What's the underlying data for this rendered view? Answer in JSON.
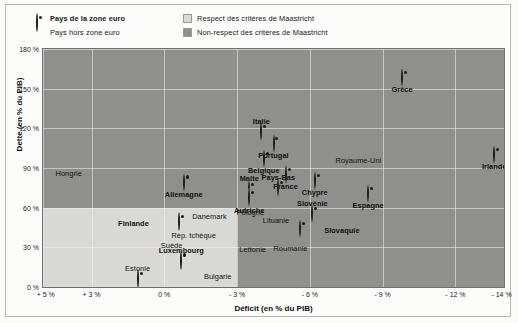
{
  "legend": {
    "items": [
      {
        "marker": "euro-circle-marker",
        "label": "Pays de la zone euro",
        "bold": true
      },
      {
        "marker": "dot-marker",
        "label": "Pays hors zone euro",
        "bold": false
      },
      {
        "marker": "light-swatch",
        "label": "Respect des critères de Maastricht",
        "bold": false
      },
      {
        "marker": "dark-swatch",
        "label": "Non-respect des critères de Maastricht",
        "bold": false
      }
    ]
  },
  "colors": {
    "respect_zone": "#d8d8d4",
    "non_respect_zone": "#8f8f8c",
    "marker": "#1d1d1d",
    "grid": "#f3f3f0"
  },
  "chart_data": {
    "type": "scatter",
    "title": "",
    "xlabel": "Déficit (en % du PIB)",
    "ylabel": "Dette (en % du PIB)",
    "xlim": [
      5,
      -14
    ],
    "ylim": [
      0,
      180
    ],
    "xticks": [
      "+ 5 %",
      "+ 3 %",
      "0 %",
      "- 3 %",
      "- 6 %",
      "- 9 %",
      "- 12 %",
      "- 14 %"
    ],
    "xtick_values": [
      5,
      3,
      0,
      -3,
      -6,
      -9,
      -12,
      -14
    ],
    "yticks": [
      "0 %",
      "30 %",
      "60 %",
      "90 %",
      "120 %",
      "150 %",
      "180 %"
    ],
    "ytick_values": [
      0,
      30,
      60,
      90,
      120,
      150,
      180
    ],
    "grid": true,
    "legend_position": "top",
    "maastricht_zone": {
      "x_from": 5,
      "x_to": -3,
      "y_from": 0,
      "y_to": 60
    },
    "points": [
      {
        "name": "Hongrie",
        "x": 3.9,
        "y": 78,
        "euro": false,
        "lx": -1,
        "ly": -11,
        "bold": false
      },
      {
        "name": "Allemagne",
        "x": -0.8,
        "y": 79,
        "euro": true,
        "lx": 0,
        "ly": 11,
        "bold": true
      },
      {
        "name": "Danemark",
        "x": -1.9,
        "y": 46,
        "euro": false,
        "lx": -1,
        "ly": -10,
        "bold": false
      },
      {
        "name": "Finlande",
        "x": -0.6,
        "y": 49,
        "euro": true,
        "lx": -30,
        "ly": 1,
        "bold": true
      },
      {
        "name": "Suède",
        "x": -0.3,
        "y": 39,
        "euro": false,
        "lx": 0,
        "ly": 10,
        "bold": false
      },
      {
        "name": "Rép. tchèque",
        "x": -3.2,
        "y": 41,
        "euro": false,
        "lx": -26,
        "ly": 2,
        "bold": false
      },
      {
        "name": "Lettonie",
        "x": -3.6,
        "y": 37,
        "euro": false,
        "lx": 1,
        "ly": 11,
        "bold": false
      },
      {
        "name": "Luxembourg",
        "x": -0.7,
        "y": 20,
        "euro": true,
        "lx": 0,
        "ly": -11,
        "bold": true
      },
      {
        "name": "Estonie",
        "x": 1.1,
        "y": 6,
        "euro": true,
        "lx": 0,
        "ly": -11,
        "bold": false
      },
      {
        "name": "Bulgarie",
        "x": -2.2,
        "y": 17,
        "euro": false,
        "lx": 0,
        "ly": 11,
        "bold": false
      },
      {
        "name": "Malte",
        "x": -3.5,
        "y": 73,
        "euro": true,
        "lx": 0,
        "ly": -12,
        "bold": true
      },
      {
        "name": "Autriche",
        "x": -3.5,
        "y": 67,
        "euro": true,
        "lx": 0,
        "ly": 12,
        "bold": true
      },
      {
        "name": "Belgique",
        "x": -4.1,
        "y": 97,
        "euro": true,
        "lx": 0,
        "ly": 11,
        "bold": true
      },
      {
        "name": "Portugal",
        "x": -4.5,
        "y": 108,
        "euro": true,
        "lx": 0,
        "ly": 11,
        "bold": true
      },
      {
        "name": "Italie",
        "x": -4.0,
        "y": 117,
        "euro": true,
        "lx": 0,
        "ly": -11,
        "bold": true
      },
      {
        "name": "France",
        "x": -5.0,
        "y": 85,
        "euro": true,
        "lx": 0,
        "ly": 11,
        "bold": true
      },
      {
        "name": "Pays-Bas",
        "x": -4.7,
        "y": 75,
        "euro": true,
        "lx": 0,
        "ly": -11,
        "bold": true
      },
      {
        "name": "Pologne",
        "x": -5.1,
        "y": 56,
        "euro": false,
        "lx": -24,
        "ly": -1,
        "bold": false
      },
      {
        "name": "Lituanie",
        "x": -4.6,
        "y": 42,
        "euro": false,
        "lx": 0,
        "ly": -11,
        "bold": false
      },
      {
        "name": "Chypre",
        "x": -6.2,
        "y": 80,
        "euro": true,
        "lx": 0,
        "ly": 11,
        "bold": true
      },
      {
        "name": "Slovénie",
        "x": -6.1,
        "y": 55,
        "euro": true,
        "lx": 0,
        "ly": -11,
        "bold": true
      },
      {
        "name": "Slovaquie",
        "x": -5.6,
        "y": 44,
        "euro": true,
        "lx": 24,
        "ly": 1,
        "bold": true
      },
      {
        "name": "Roumanie",
        "x": -5.2,
        "y": 38,
        "euro": false,
        "lx": 0,
        "ly": 11,
        "bold": false
      },
      {
        "name": "Espagne",
        "x": -8.4,
        "y": 70,
        "euro": true,
        "lx": 0,
        "ly": 11,
        "bold": true
      },
      {
        "name": "Royaume-Uni",
        "x": -8.0,
        "y": 88,
        "euro": false,
        "lx": 0,
        "ly": -11,
        "bold": false
      },
      {
        "name": "Grèce",
        "x": -9.8,
        "y": 158,
        "euro": true,
        "lx": 0,
        "ly": 11,
        "bold": true
      },
      {
        "name": "Irlande",
        "x": -13.6,
        "y": 100,
        "euro": true,
        "lx": 0,
        "ly": 11,
        "bold": true
      }
    ]
  }
}
